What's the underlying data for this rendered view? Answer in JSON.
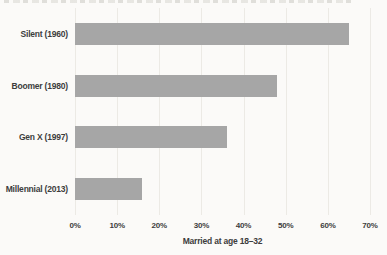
{
  "chart_data": {
    "type": "bar",
    "orientation": "horizontal",
    "categories": [
      "Silent (1960)",
      "Boomer (1980)",
      "Gen X (1997)",
      "Millennial (2013)"
    ],
    "values": [
      65,
      48,
      36,
      16
    ],
    "title": "",
    "xlabel": "Married at age 18–32",
    "ylabel": "",
    "x_tick_labels": [
      "0%",
      "10%",
      "20%",
      "30%",
      "40%",
      "50%",
      "60%",
      "70%"
    ],
    "x_tick_values": [
      0,
      10,
      20,
      30,
      40,
      50,
      60,
      70
    ],
    "xlim": [
      0,
      70
    ],
    "grid": "vertical-faint",
    "legend": "none",
    "bar_color": "#a6a6a6",
    "text_color": "#3d3d3d",
    "gridline_color": "#eceae5",
    "background_color": "#fbfaf8"
  }
}
